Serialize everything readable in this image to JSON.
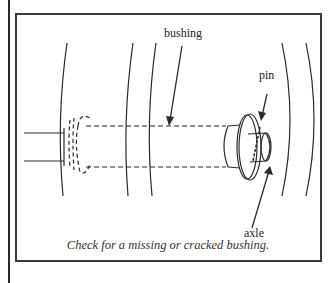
{
  "figure": {
    "labels": {
      "bushing": "bushing",
      "pin": "pin",
      "axle": "axle"
    },
    "caption": "Check for a missing or cracked bushing.",
    "colors": {
      "line": "#2a2a2a",
      "background": "#ffffff"
    }
  }
}
